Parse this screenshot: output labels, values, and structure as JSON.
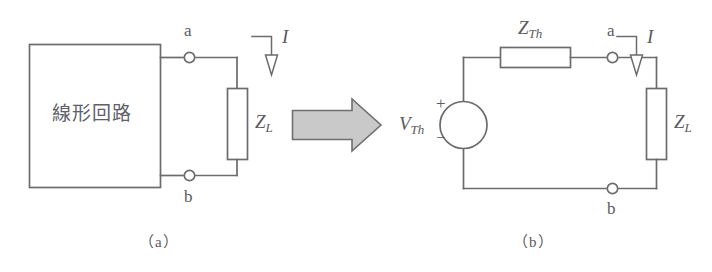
{
  "figure": {
    "colors": {
      "line": "#6b6b70",
      "text": "#5a5a60",
      "arrow_fill": "#c9c9c9",
      "arrow_stroke": "#6e6e73",
      "background": "#ffffff"
    },
    "panels": [
      {
        "id": "panel-a",
        "caption": "（a）",
        "block": {
          "label": "線形回路",
          "kind": "linear-circuit-block"
        },
        "terminals": [
          {
            "name": "a",
            "label": "a",
            "position": "top"
          },
          {
            "name": "b",
            "label": "b",
            "position": "bottom"
          }
        ],
        "components": [
          {
            "kind": "impedance",
            "label": "Z",
            "subscript": "L",
            "orientation": "vertical"
          }
        ],
        "annotations": [
          {
            "kind": "current-arrow",
            "label": "I",
            "direction": "down"
          }
        ]
      },
      {
        "id": "panel-b",
        "caption": "（b）",
        "terminals": [
          {
            "name": "a",
            "label": "a",
            "position": "top"
          },
          {
            "name": "b",
            "label": "b",
            "position": "bottom"
          }
        ],
        "components": [
          {
            "kind": "impedance",
            "label": "Z",
            "subscript": "Th",
            "orientation": "horizontal"
          },
          {
            "kind": "impedance",
            "label": "Z",
            "subscript": "L",
            "orientation": "vertical"
          },
          {
            "kind": "voltage-source",
            "label": "V",
            "subscript": "Th",
            "plus": "+",
            "minus": "−"
          }
        ],
        "annotations": [
          {
            "kind": "current-arrow",
            "label": "I",
            "direction": "down"
          }
        ]
      }
    ],
    "transition": {
      "kind": "block-arrow",
      "direction": "right"
    }
  }
}
